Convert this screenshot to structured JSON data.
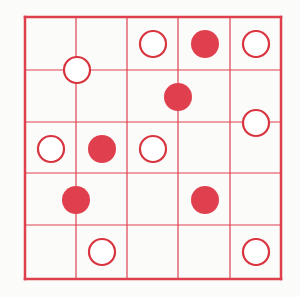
{
  "puzzle": {
    "type": "masyu",
    "rows": 5,
    "cols": 5,
    "grid": {
      "x_lines": [
        25,
        76,
        127,
        178,
        230,
        281
      ],
      "y_lines": [
        17,
        70,
        122,
        173,
        225,
        279
      ],
      "line_color": "#e0404e",
      "outer_stroke": 2.5,
      "inner_stroke": 1.2
    },
    "pearl_radius": 14,
    "pearls": [
      {
        "kind": "white",
        "cx": 153,
        "cy": 44
      },
      {
        "kind": "black",
        "cx": 205,
        "cy": 44
      },
      {
        "kind": "white",
        "cx": 256,
        "cy": 44
      },
      {
        "kind": "white",
        "cx": 77,
        "cy": 70
      },
      {
        "kind": "black",
        "cx": 178,
        "cy": 97
      },
      {
        "kind": "white",
        "cx": 256,
        "cy": 123
      },
      {
        "kind": "white",
        "cx": 51,
        "cy": 149
      },
      {
        "kind": "black",
        "cx": 102,
        "cy": 149
      },
      {
        "kind": "white",
        "cx": 153,
        "cy": 149
      },
      {
        "kind": "black",
        "cx": 76,
        "cy": 200
      },
      {
        "kind": "black",
        "cx": 205,
        "cy": 200
      },
      {
        "kind": "white",
        "cx": 102,
        "cy": 252
      },
      {
        "kind": "white",
        "cx": 256,
        "cy": 252
      }
    ],
    "colors": {
      "pearl_fill_black": "#e0404e",
      "pearl_fill_white": "#ffffff",
      "pearl_stroke": "#d8343f",
      "background": "#fbfbf9"
    }
  }
}
